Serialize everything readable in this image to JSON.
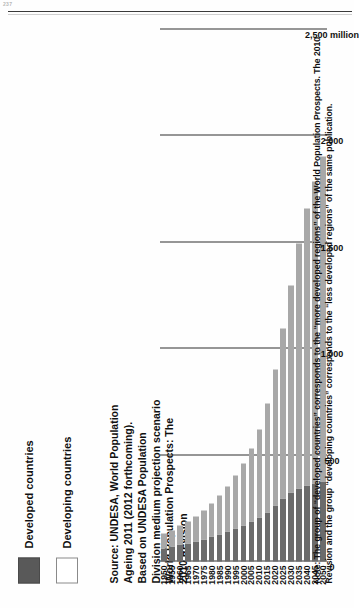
{
  "page": {
    "page_number": "237",
    "background_color": "#ffffff"
  },
  "legend": {
    "items": [
      {
        "label": "Developed countries",
        "color": "#595959",
        "swatch": "dark"
      },
      {
        "label": "Developing countries",
        "color": "#ffffff",
        "swatch": "light"
      }
    ]
  },
  "source": {
    "text": "Source: UNDESA, World Population Ageing 2011 (2012 forthcoming). Based on UNDESA Population Division medium projection scenario World Population Prospects: The 2010 Revision"
  },
  "note": {
    "text": "Note: The group of “developed countries” corresponds to the “more developed regions” of the World Population Prospects. The 2010 Revision and the group “developing countries” corresponds to the “less developed regions” of the same publication."
  },
  "chart_data": {
    "type": "bar",
    "orientation": "horizontal-stacked",
    "title": "",
    "xlabel": "",
    "ylabel": "",
    "unit_label": "2,500 million",
    "xlim": [
      0,
      2500
    ],
    "grid": true,
    "legend_position": "top-left",
    "tick_labels": [
      "2,500 million",
      "2,000",
      "1,500",
      "1,000",
      "500",
      "0"
    ],
    "tick_values": [
      2500,
      2000,
      1500,
      1000,
      500,
      0
    ],
    "categories": [
      "1950",
      "1955",
      "1960",
      "1965",
      "1970",
      "1975",
      "1980",
      "1985",
      "1990",
      "1995",
      "2000",
      "2005",
      "2010",
      "2015",
      "2020",
      "2025",
      "2030",
      "2035",
      "2040",
      "2045",
      "2050"
    ],
    "series": [
      {
        "name": "Developed countries",
        "color": "#6b6b6b",
        "values": [
          63,
          70,
          78,
          86,
          95,
          105,
          116,
          128,
          142,
          157,
          171,
          186,
          207,
          232,
          263,
          295,
          323,
          344,
          358,
          368,
          375
        ]
      },
      {
        "name": "Developing countries",
        "color": "#a8a8a8",
        "values": [
          68,
          78,
          89,
          101,
          117,
          135,
          156,
          181,
          212,
          248,
          290,
          345,
          415,
          512,
          640,
          800,
          975,
          1150,
          1300,
          1420,
          1530
        ]
      }
    ],
    "totals": [
      131,
      148,
      167,
      187,
      212,
      240,
      272,
      309,
      354,
      405,
      461,
      531,
      622,
      744,
      903,
      1095,
      1298,
      1494,
      1658,
      1788,
      1905
    ]
  }
}
